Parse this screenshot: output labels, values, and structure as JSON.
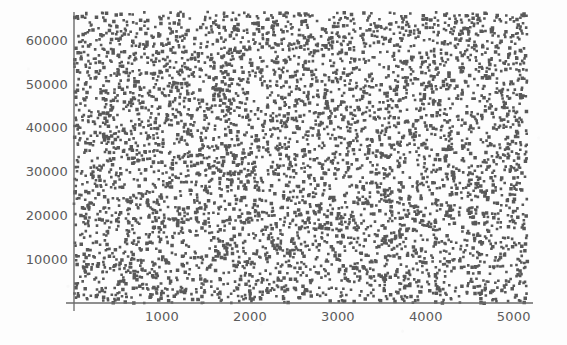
{
  "figure": {
    "background_color": "#fdfdfd",
    "point_color": "#4a4a4a",
    "axis_color": "#6a6a6a",
    "tick_label_color": "#5b5b5b"
  },
  "chart_data": {
    "type": "scatter",
    "title": "",
    "subtitle": "",
    "xlabel": "",
    "ylabel": "",
    "xlim": [
      0,
      5150
    ],
    "ylim": [
      0,
      66500
    ],
    "grid": false,
    "legend": null,
    "n_points": 5000,
    "marker": {
      "shape": "square",
      "size_px": 2.6,
      "color": "#4a4a4a",
      "opacity": 0.92
    },
    "distribution": {
      "x": {
        "type": "uniform",
        "min": 0,
        "max": 5150
      },
      "y": {
        "type": "uniform",
        "min": 0,
        "max": 66500
      }
    },
    "xticks": [
      1000,
      2000,
      3000,
      4000,
      5000
    ],
    "xtick_labels": [
      "1000",
      "2000",
      "3000",
      "4000",
      "5000"
    ],
    "yticks": [
      10000,
      20000,
      30000,
      40000,
      50000,
      60000
    ],
    "ytick_labels": [
      "10000",
      "20000",
      "30000",
      "40000",
      "50000",
      "60000"
    ],
    "axes": {
      "left_spine": true,
      "bottom_spine": true,
      "top_spine": false,
      "right_spine": false,
      "origin_tick": true
    }
  },
  "plot_box": {
    "left_px": 74,
    "right_px": 527,
    "top_px": 12,
    "bottom_px": 303
  }
}
